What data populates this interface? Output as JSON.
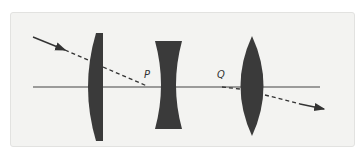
{
  "diagram": {
    "colors": {
      "background": "#f3f3f1",
      "lens": "#3a3a3a",
      "ray": "#333333",
      "axis": "#444444"
    },
    "optical_axis": {
      "y": 87,
      "x_start": 33,
      "x_end": 320
    },
    "lenses": [
      {
        "name": "plano-convex lens",
        "type": "plano-convex",
        "x": 86,
        "width": 17,
        "y_top": 33,
        "y_bottom": 141
      },
      {
        "name": "biconcave lens",
        "type": "biconcave",
        "x": 155,
        "width": 27,
        "y_top": 41,
        "y_bottom": 129
      },
      {
        "name": "biconvex lens",
        "type": "biconvex",
        "x": 240,
        "width": 25,
        "y_top": 36,
        "y_bottom": 136
      }
    ],
    "points": [
      {
        "label": "P",
        "x": 147,
        "y": 87
      },
      {
        "label": "Q",
        "x": 220,
        "y": 87
      }
    ],
    "rays": {
      "incident": "solid arrow toward lens 1",
      "between": "dashed line from lens 1 to P",
      "exit": "dashed arrow after lens 3"
    }
  }
}
